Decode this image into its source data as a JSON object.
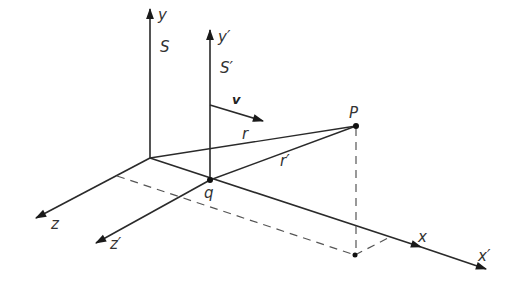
{
  "diagram": {
    "colors": {
      "line": "#2a2a2a",
      "dashed": "#555555",
      "text": "#333333",
      "background": "#ffffff"
    },
    "labels": {
      "y": "y",
      "S": "S",
      "y_prime": "y′",
      "S_prime": "S′",
      "v": "v",
      "r": "r",
      "r_prime": "r′",
      "P": "P",
      "q": "q",
      "z": "z",
      "z_prime": "z′",
      "x": "x",
      "x_prime": "x′"
    }
  }
}
